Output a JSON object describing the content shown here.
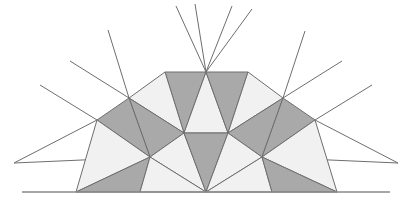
{
  "figure": {
    "type": "geometric-diagram",
    "canvas": {
      "width": 408,
      "height": 209,
      "background": "#ffffff"
    },
    "colors": {
      "fill_dark": "#a9a9a9",
      "fill_light": "#f1f1f1",
      "stroke": "#6e6e6e",
      "baseline_stroke": "#8a8a8a",
      "background": "#ffffff"
    },
    "stroke_width": 1,
    "symmetry": {
      "axis": "vertical",
      "x": 206
    },
    "points": {
      "apex_center": [
        206,
        72
      ],
      "top_left": [
        165,
        72
      ],
      "top_right": [
        248,
        72
      ],
      "upper_left": [
        129,
        98
      ],
      "upper_right": [
        283,
        98
      ],
      "mid_left": [
        97,
        120
      ],
      "mid_right": [
        315,
        120
      ],
      "hex_left": [
        184,
        133
      ],
      "hex_right": [
        228,
        133
      ],
      "ring_left": [
        150,
        157
      ],
      "ring_right": [
        262,
        157
      ],
      "base_center": [
        206,
        192
      ],
      "base_left": [
        76,
        192
      ],
      "base_right": [
        337,
        192
      ]
    },
    "tiles": [
      {
        "name": "crown-left-dark",
        "tone": "dark",
        "points": "165,72 206,72 184,133"
      },
      {
        "name": "crown-center-light",
        "tone": "light",
        "points": "206,72 184,133 228,133"
      },
      {
        "name": "crown-right-dark",
        "tone": "dark",
        "points": "206,72 248,72 228,133"
      },
      {
        "name": "shoulder-left-light",
        "tone": "light",
        "points": "129,98 165,72 184,133"
      },
      {
        "name": "shoulder-left-dark",
        "tone": "dark",
        "points": "129,98 184,133 150,157"
      },
      {
        "name": "shoulder-right-light",
        "tone": "light",
        "points": "283,98 248,72 228,133"
      },
      {
        "name": "shoulder-right-dark",
        "tone": "dark",
        "points": "283,98 228,133 262,157"
      },
      {
        "name": "flank-left-dark",
        "tone": "dark",
        "points": "97,120 129,98 150,157"
      },
      {
        "name": "flank-left-light",
        "tone": "light",
        "points": "97,120 150,157 76,192"
      },
      {
        "name": "flank-right-dark",
        "tone": "dark",
        "points": "315,120 283,98 262,157"
      },
      {
        "name": "flank-right-light",
        "tone": "light",
        "points": "315,120 262,157 337,192"
      },
      {
        "name": "base-left-dark",
        "tone": "dark",
        "points": "76,192 150,157 140,192"
      },
      {
        "name": "base-inner-left-light",
        "tone": "light",
        "points": "150,157 184,133 206,192"
      },
      {
        "name": "base-wedge-left-light",
        "tone": "light",
        "points": "150,157 206,192 140,192"
      },
      {
        "name": "base-center-dark",
        "tone": "dark",
        "points": "184,133 228,133 206,192"
      },
      {
        "name": "base-inner-right-light",
        "tone": "light",
        "points": "262,157 228,133 206,192"
      },
      {
        "name": "base-wedge-right-light",
        "tone": "light",
        "points": "262,157 206,192 272,192"
      },
      {
        "name": "base-right-dark",
        "tone": "dark",
        "points": "337,192 262,157 272,192"
      }
    ],
    "rays": [
      {
        "name": "ray-apex-left",
        "from": [
          206,
          72
        ],
        "to": [
          176,
          6
        ]
      },
      {
        "name": "ray-apex-up-left",
        "from": [
          206,
          72
        ],
        "to": [
          195,
          4
        ]
      },
      {
        "name": "ray-apex-up-right",
        "from": [
          206,
          72
        ],
        "to": [
          232,
          6
        ]
      },
      {
        "name": "ray-apex-right",
        "from": [
          206,
          72
        ],
        "to": [
          252,
          9
        ]
      },
      {
        "name": "ray-upper-left-a",
        "from": [
          129,
          98
        ],
        "to": [
          108,
          30
        ]
      },
      {
        "name": "ray-upper-left-b",
        "from": [
          129,
          98
        ],
        "to": [
          70,
          61
        ]
      },
      {
        "name": "ray-upper-right-a",
        "from": [
          283,
          98
        ],
        "to": [
          305,
          31
        ]
      },
      {
        "name": "ray-upper-right-b",
        "from": [
          283,
          98
        ],
        "to": [
          342,
          61
        ]
      },
      {
        "name": "ray-mid-left-a",
        "from": [
          97,
          120
        ],
        "to": [
          40,
          85
        ]
      },
      {
        "name": "ray-mid-left-b",
        "from": [
          97,
          120
        ],
        "to": [
          14,
          163
        ]
      },
      {
        "name": "ray-mid-right-a",
        "from": [
          315,
          120
        ],
        "to": [
          372,
          85
        ]
      },
      {
        "name": "ray-mid-right-b",
        "from": [
          315,
          120
        ],
        "to": [
          398,
          163
        ]
      },
      {
        "name": "ray-ring-left-out",
        "from": [
          150,
          157
        ],
        "to": [
          14,
          163
        ]
      },
      {
        "name": "ray-ring-right-out",
        "from": [
          262,
          157
        ],
        "to": [
          398,
          163
        ]
      },
      {
        "name": "ray-ring-left-up",
        "from": [
          150,
          157
        ],
        "to": [
          97,
          120
        ]
      },
      {
        "name": "ray-ring-right-up",
        "from": [
          262,
          157
        ],
        "to": [
          315,
          120
        ]
      }
    ],
    "baselines": [
      {
        "name": "baseline-left",
        "from": [
          22,
          192
        ],
        "to": [
          206,
          192
        ]
      },
      {
        "name": "baseline-right",
        "from": [
          206,
          192
        ],
        "to": [
          390,
          192
        ]
      }
    ]
  }
}
